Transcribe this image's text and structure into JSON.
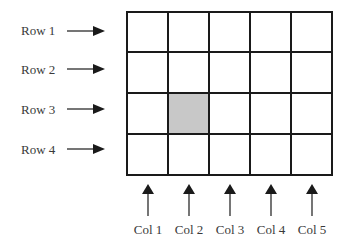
{
  "diagram": {
    "rows": [
      {
        "label": "Row 1"
      },
      {
        "label": "Row 2"
      },
      {
        "label": "Row 3"
      },
      {
        "label": "Row 4"
      }
    ],
    "columns": [
      {
        "label": "Col 1"
      },
      {
        "label": "Col 2"
      },
      {
        "label": "Col 3"
      },
      {
        "label": "Col 4"
      },
      {
        "label": "Col 5"
      }
    ],
    "highlighted_cell": {
      "row": 3,
      "col": 2
    },
    "colors": {
      "grid_line": "#1a1a1a",
      "highlight_fill": "#c8c8c8",
      "arrow": "#1a1a1a",
      "text": "#3a3a3a"
    }
  }
}
